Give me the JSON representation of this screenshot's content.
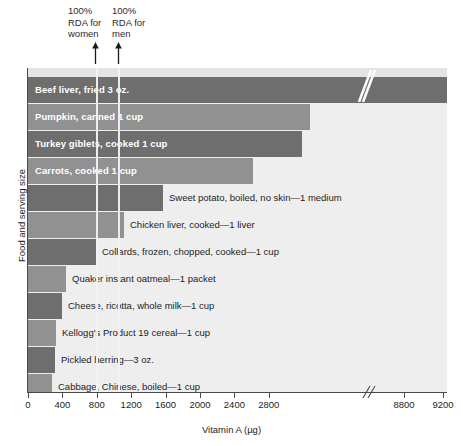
{
  "chart_data": {
    "type": "bar",
    "orientation": "horizontal",
    "title": "",
    "xlabel": "Vitamin A (µg)",
    "ylabel": "Food and serving size",
    "xlim": [
      0,
      9200
    ],
    "grid": false,
    "legend": "none",
    "axis_break": {
      "after": 2800,
      "resume_at": 8800,
      "label": "//"
    },
    "xticks": [
      0,
      400,
      800,
      1200,
      1600,
      2000,
      2400,
      2800,
      8800,
      9200
    ],
    "xtick_labels": [
      "0",
      "400",
      "800",
      "1200",
      "1600",
      "2000",
      "2400",
      "2800",
      "8800",
      "9200"
    ],
    "categories": [
      "Beef liver, fried 3 oz.",
      "Pumpkin, canned 1 cup",
      "Turkey giblets, cooked 1 cup",
      "Carrots, cooked 1 cup",
      "Sweet potato, boiled, no skin—1 medium",
      "Chicken liver, cooked—1 liver",
      "Collards, frozen, chopped, cooked—1 cup",
      "Quaker instant oatmeal—1 packet",
      "Cheese, ricotta, whole milk—1 cup",
      "Kellogg's Product 19 cereal—1 cup",
      "Pickled herring—3 oz.",
      "Cabbage, Chinese, boiled—1 cup"
    ],
    "values": [
      9120,
      2650,
      2500,
      1900,
      1500,
      1070,
      800,
      450,
      330,
      290,
      260,
      220
    ],
    "annotations": [
      {
        "name": "rda-women",
        "label": "100%\nRDA for\nwomen",
        "value": 800
      },
      {
        "name": "rda-men",
        "label": "100%\nRDA for\nmen",
        "value": 1000
      }
    ],
    "bars": [
      {
        "label": "Beef liver, fried 3 oz.",
        "value": 9120,
        "px_end": 447,
        "label_inside": true,
        "shade": "dark"
      },
      {
        "label": "Pumpkin, canned 1 cup",
        "value": 2650,
        "px_end": 310,
        "label_inside": true,
        "shade": "light"
      },
      {
        "label": "Turkey giblets, cooked 1 cup",
        "value": 2500,
        "px_end": 302,
        "label_inside": true,
        "shade": "dark"
      },
      {
        "label": "Carrots, cooked 1 cup",
        "value": 1900,
        "px_end": 253,
        "label_inside": true,
        "shade": "light"
      },
      {
        "label": "Sweet potato, boiled, no skin—1 medium",
        "value": 1500,
        "px_end": 163,
        "label_inside": false,
        "shade": "dark"
      },
      {
        "label": "Chicken liver, cooked—1 liver",
        "value": 1070,
        "px_end": 124,
        "label_inside": false,
        "shade": "light"
      },
      {
        "label": "Collards, frozen, chopped, cooked—1 cup",
        "value": 800,
        "px_end": 96,
        "label_inside": false,
        "shade": "dark"
      },
      {
        "label": "Quaker instant oatmeal—1 packet",
        "value": 450,
        "px_end": 66,
        "label_inside": false,
        "shade": "light"
      },
      {
        "label": "Cheese, ricotta, whole milk—1 cup",
        "value": 330,
        "px_end": 62,
        "label_inside": false,
        "shade": "dark"
      },
      {
        "label": "Kellogg's Product 19 cereal—1 cup",
        "value": 290,
        "px_end": 56,
        "label_inside": false,
        "shade": "light"
      },
      {
        "label": "Pickled herring—3 oz.",
        "value": 260,
        "px_end": 55,
        "label_inside": false,
        "shade": "dark"
      },
      {
        "label": "Cabbage, Chinese, boiled—1 cup",
        "value": 220,
        "px_end": 52,
        "label_inside": false,
        "shade": "light"
      }
    ],
    "colors": {
      "bar_dark": "#6e6e6e",
      "bar_light": "#919191",
      "plot_background": "#eeeeee",
      "axis": "#4a4a4a",
      "label_inside": "#ffffff",
      "label_outside": "#1d1d1d",
      "rda_line": "#f2f2f2"
    }
  }
}
